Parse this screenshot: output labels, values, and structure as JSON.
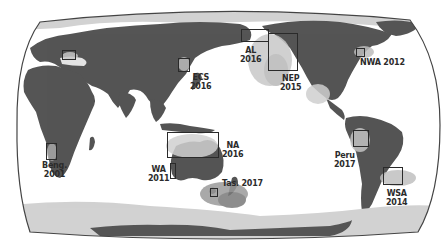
{
  "map": {
    "title": "",
    "projection": "Pacific-centered world map (equal-area / Robinson-like)",
    "colors": {
      "land": "#555555",
      "ice": "#d2d2d2",
      "ocean": "#ffffff",
      "anomaly_light": "#bdbdbd",
      "anomaly_dark": "#7a7a7a",
      "outline": "#444444",
      "box": "#2a2a2a"
    },
    "regions": [
      {
        "id": "med",
        "label": "Med",
        "year": "",
        "text": "",
        "box": [
          62,
          50,
          14,
          10
        ]
      },
      {
        "id": "ecs",
        "label": "ECS",
        "year": "2016",
        "text": "ECS\n2016",
        "box": [
          178,
          58,
          12,
          14
        ]
      },
      {
        "id": "al",
        "label": "AL",
        "year": "2016",
        "text": "AL\n2016",
        "box": [
          241,
          29,
          28,
          13
        ]
      },
      {
        "id": "nep",
        "label": "NEP",
        "year": "2015",
        "text": "NEP\n2015",
        "box": [
          268,
          33,
          30,
          38
        ]
      },
      {
        "id": "nwa",
        "label": "NWA",
        "year": "2012",
        "text": "NWA 2012",
        "box": [
          356,
          48,
          9,
          9
        ]
      },
      {
        "id": "beng",
        "label": "Beng.",
        "year": "2001",
        "text": "Beng.\n2001",
        "box": [
          46,
          143,
          11,
          17
        ]
      },
      {
        "id": "na",
        "label": "NA",
        "year": "2016",
        "text": "NA\n2016",
        "box": [
          167,
          132,
          52,
          26
        ]
      },
      {
        "id": "wa",
        "label": "WA",
        "year": "2011",
        "text": "WA\n2011",
        "box": [
          170,
          163,
          6,
          16
        ]
      },
      {
        "id": "tas",
        "label": "Tas.",
        "year": "2017",
        "text": "Tas. 2017",
        "box": [
          210,
          188,
          8,
          9
        ]
      },
      {
        "id": "peru",
        "label": "Peru",
        "year": "2017",
        "text": "Peru\n2017",
        "box": [
          353,
          130,
          16,
          17
        ]
      },
      {
        "id": "wsa",
        "label": "WSA",
        "year": "2014",
        "text": "WSA\n2014",
        "box": [
          383,
          167,
          20,
          18
        ]
      }
    ]
  }
}
